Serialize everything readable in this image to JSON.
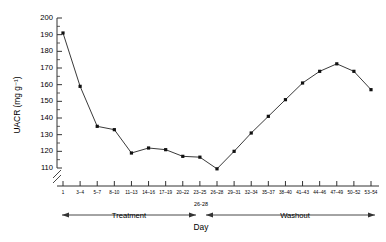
{
  "chart_data": {
    "type": "line",
    "title": "",
    "xlabel": "Day",
    "ylabel": "UACR (mg g⁻¹)",
    "ylim": [
      110,
      200
    ],
    "axis_break": true,
    "grid": false,
    "legend": "none",
    "ytick_labels": [
      "110",
      "120",
      "130",
      "140",
      "150",
      "160",
      "170",
      "180",
      "190",
      "200"
    ],
    "ytick_values": [
      110,
      120,
      130,
      140,
      150,
      160,
      170,
      180,
      190,
      200
    ],
    "categories": [
      "1",
      "3–4",
      "5–7",
      "8–10",
      "11–13",
      "14–16",
      "17–19",
      "20–22",
      "23–25",
      "26–28",
      "29–31",
      "32–34",
      "35–37",
      "38–40",
      "41–43",
      "44–46",
      "47–49",
      "50–52",
      "53–54"
    ],
    "values": [
      191,
      159,
      135,
      133,
      119,
      122,
      121,
      117,
      116.5,
      109.5,
      120,
      131,
      141,
      151,
      161,
      168,
      172.5,
      168,
      157
    ],
    "annotations": {
      "treatment_label": "Treatment",
      "washout_label": "Washout",
      "midpoint_label": "26-28",
      "day_label": "Day"
    }
  },
  "colors": {
    "line": "#3a3a3a",
    "marker": "#111111",
    "axis": "#333333",
    "background": "#ffffff"
  }
}
